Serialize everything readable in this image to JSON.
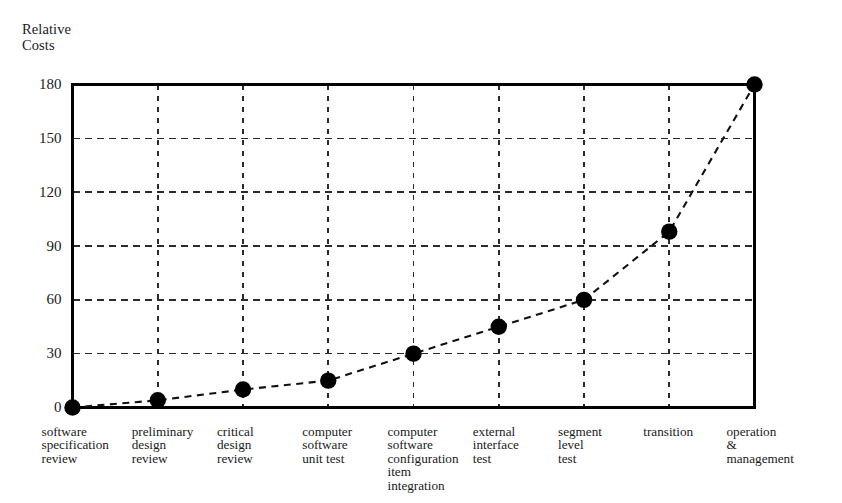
{
  "chart_data": {
    "type": "line",
    "title": "",
    "ylabel": "Relative\nCosts",
    "xlabel": "",
    "ylim": [
      0,
      180
    ],
    "yticks": [
      0,
      30,
      60,
      90,
      120,
      150,
      180
    ],
    "grid": true,
    "legend": "none",
    "marker": "filled-circle",
    "linestyle": "dashed",
    "categories": [
      "software\nspecification\nreview",
      "preliminary\ndesign\nreview",
      "critical\ndesign\nreview",
      "computer\nsoftware\nunit test",
      "computer\nsoftware\nconfiguration\nitem\nintegration",
      "external\ninterface\ntest",
      "segment\nlevel\ntest",
      "transition",
      "operation\n&\nmanagement"
    ],
    "values": [
      0,
      4,
      10,
      15,
      30,
      45,
      60,
      98,
      180
    ],
    "series": [
      {
        "name": "Relative Costs",
        "values": [
          0,
          4,
          10,
          15,
          30,
          45,
          60,
          98,
          180
        ]
      }
    ],
    "colors": {
      "line": "#111111",
      "marker": "#000000",
      "grid": "#2b2b2b",
      "frame": "#000000",
      "background": "#ffffff",
      "text": "#1a1a1a"
    }
  }
}
